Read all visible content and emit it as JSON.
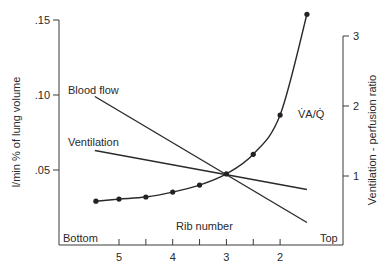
{
  "chart_data": {
    "type": "line",
    "title": "",
    "xlabel": "Rib number",
    "x_end_labels": {
      "left": "Bottom",
      "right": "Top"
    },
    "x_ticks": [
      5,
      4.5,
      4,
      3.5,
      3,
      2.5,
      2
    ],
    "x_tick_labels": [
      "5",
      "4",
      "3",
      "2"
    ],
    "xlim": [
      5.7,
      1.2
    ],
    "ylabel": "l/min % of lung volume",
    "ylim": [
      0,
      0.15
    ],
    "y_ticks": [
      0.05,
      0.1,
      0.15
    ],
    "y_tick_labels": [
      ".05",
      ".10",
      ".15"
    ],
    "y2label": "Ventilation - perfusion ratio",
    "y2lim": [
      0,
      3.5
    ],
    "y2_ticks": [
      1,
      2,
      3
    ],
    "y2_tick_labels": [
      "1",
      "2",
      "3"
    ],
    "series": [
      {
        "name": "Blood flow",
        "axis": "left",
        "x": [
          5.45,
          1.5
        ],
        "values": [
          0.099,
          0.015
        ]
      },
      {
        "name": "Ventilation",
        "axis": "left",
        "x": [
          5.45,
          1.5
        ],
        "values": [
          0.063,
          0.037
        ]
      },
      {
        "name": "V̇A/Q̇",
        "axis": "right",
        "markers": true,
        "x": [
          5.43,
          5.0,
          4.5,
          4.0,
          3.5,
          3.0,
          2.5,
          2.0,
          1.5
        ],
        "values": [
          0.64,
          0.67,
          0.7,
          0.77,
          0.87,
          1.03,
          1.31,
          1.87,
          3.31
        ]
      }
    ],
    "annotations": [
      "Blood flow",
      "Ventilation",
      "V̇A/Q̇",
      "Rib number",
      "Bottom",
      "Top"
    ],
    "grid": false,
    "legend": "none (inline labels)"
  },
  "labels": {
    "blood_flow": "Blood flow",
    "ventilation": "Ventilation",
    "vaq": "V̇A/Q̇",
    "rib_number": "Rib number",
    "bottom": "Bottom",
    "top": "Top",
    "ylabel_left": "l/min % of lung volume",
    "ylabel_right": "Ventilation - perfusion ratio"
  }
}
